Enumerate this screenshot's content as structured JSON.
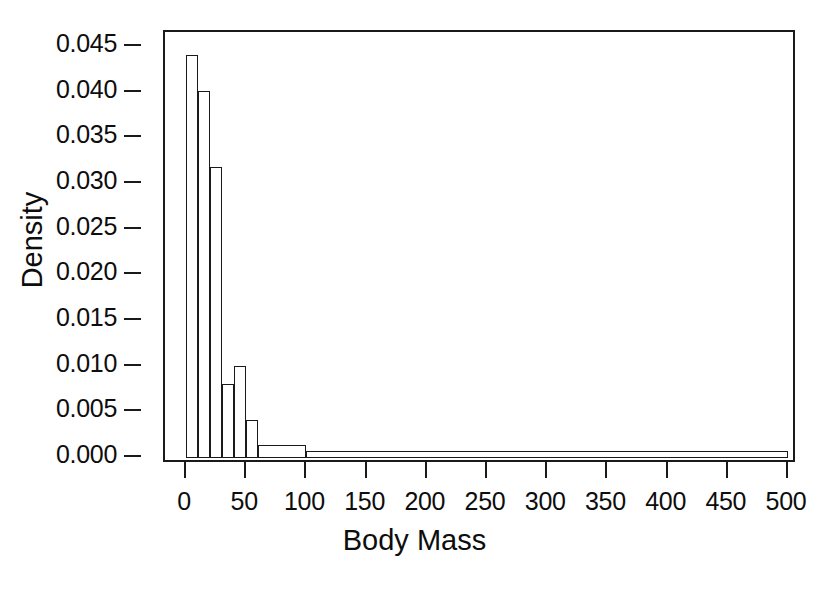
{
  "chart_data": {
    "type": "bar",
    "title": "",
    "subtitle": "",
    "xlabel": "Body Mass",
    "ylabel": "Density",
    "xlim": [
      -35,
      525
    ],
    "ylim": [
      0.0,
      0.0465
    ],
    "grid": false,
    "legend": null,
    "annotations": [],
    "style": {
      "bar_fill": "#ffffff",
      "bar_edge": "#1a1a1a",
      "axis_color": "#1a1a1a",
      "background": "#ffffff"
    },
    "xticks": [
      0,
      50,
      100,
      150,
      200,
      250,
      300,
      350,
      400,
      450,
      500
    ],
    "xtick_labels": [
      "0",
      "50",
      "100",
      "150",
      "200",
      "250",
      "300",
      "350",
      "400",
      "450",
      "500"
    ],
    "yticks": [
      0.0,
      0.005,
      0.01,
      0.015,
      0.02,
      0.025,
      0.03,
      0.035,
      0.04,
      0.045
    ],
    "ytick_labels": [
      "0.000",
      "0.005",
      "0.010",
      "0.015",
      "0.020",
      "0.025",
      "0.030",
      "0.035",
      "0.040",
      "0.045"
    ],
    "bins": [
      {
        "x0": 0,
        "x1": 10,
        "value": 0.044
      },
      {
        "x0": 10,
        "x1": 20,
        "value": 0.0401
      },
      {
        "x0": 20,
        "x1": 30,
        "value": 0.0318
      },
      {
        "x0": 30,
        "x1": 40,
        "value": 0.008
      },
      {
        "x0": 40,
        "x1": 50,
        "value": 0.01
      },
      {
        "x0": 50,
        "x1": 60,
        "value": 0.004
      },
      {
        "x0": 60,
        "x1": 100,
        "value": 0.0013
      },
      {
        "x0": 100,
        "x1": 500,
        "value": 0.0007
      }
    ],
    "categories": [
      "0-10",
      "10-20",
      "20-30",
      "30-40",
      "40-50",
      "50-60",
      "60-100",
      "100-500"
    ],
    "values": [
      0.044,
      0.0401,
      0.0318,
      0.008,
      0.01,
      0.004,
      0.0013,
      0.0007
    ]
  }
}
